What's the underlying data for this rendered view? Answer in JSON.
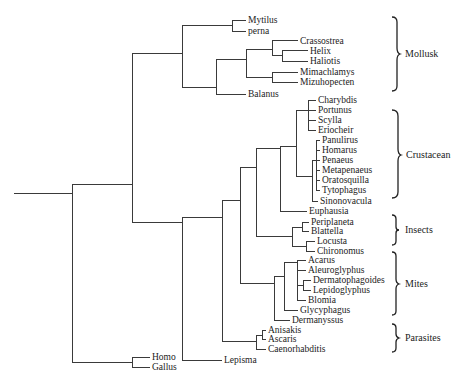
{
  "diagram": {
    "type": "phylogenetic-tree",
    "leaves": [
      {
        "id": "mytilus",
        "label": "Mytilus",
        "x": 248,
        "y": 20
      },
      {
        "id": "perna",
        "label": "perna",
        "x": 248,
        "y": 31
      },
      {
        "id": "crassostrea",
        "label": "Crassostrea",
        "x": 300,
        "y": 41
      },
      {
        "id": "helix",
        "label": "Helix",
        "x": 310,
        "y": 51
      },
      {
        "id": "haliotis",
        "label": "Haliotis",
        "x": 310,
        "y": 61
      },
      {
        "id": "mimachlamys",
        "label": "Mimachlamys",
        "x": 300,
        "y": 72
      },
      {
        "id": "mizuhopecten",
        "label": "Mizuhopecten",
        "x": 300,
        "y": 82
      },
      {
        "id": "balanus",
        "label": "Balanus",
        "x": 248,
        "y": 94
      },
      {
        "id": "charybdis",
        "label": "Charybdis",
        "x": 318,
        "y": 100
      },
      {
        "id": "portunus",
        "label": "Portunus",
        "x": 318,
        "y": 110
      },
      {
        "id": "scylla",
        "label": "Scylla",
        "x": 318,
        "y": 120
      },
      {
        "id": "eriocheir",
        "label": "Eriocheir",
        "x": 318,
        "y": 130
      },
      {
        "id": "panulirus",
        "label": "Panulirus",
        "x": 322,
        "y": 140
      },
      {
        "id": "homarus",
        "label": "Homarus",
        "x": 322,
        "y": 150
      },
      {
        "id": "penaeus",
        "label": "Penaeus",
        "x": 322,
        "y": 160
      },
      {
        "id": "metapenaeus",
        "label": "Metapenaeus",
        "x": 322,
        "y": 170
      },
      {
        "id": "oratosquilla",
        "label": "Oratosquilla",
        "x": 322,
        "y": 180
      },
      {
        "id": "tytophagus",
        "label": "Tytophagus",
        "x": 322,
        "y": 190
      },
      {
        "id": "sinonovacula",
        "label": "Sinonovacula",
        "x": 320,
        "y": 201
      },
      {
        "id": "euphausia",
        "label": "Euphausia",
        "x": 309,
        "y": 211
      },
      {
        "id": "periplaneta",
        "label": "Periplaneta",
        "x": 311,
        "y": 222
      },
      {
        "id": "blattella",
        "label": "Blattella",
        "x": 311,
        "y": 231
      },
      {
        "id": "locusta",
        "label": "Locusta",
        "x": 317,
        "y": 241
      },
      {
        "id": "chironomus",
        "label": "Chironomus",
        "x": 317,
        "y": 251
      },
      {
        "id": "acarus",
        "label": "Acarus",
        "x": 308,
        "y": 260
      },
      {
        "id": "aleuroglyphus",
        "label": "Aleuroglyphus",
        "x": 308,
        "y": 270
      },
      {
        "id": "dermatophagoides",
        "label": "Dermatophagoides",
        "x": 313,
        "y": 280
      },
      {
        "id": "lepidoglyphus",
        "label": "Lepidoglyphus",
        "x": 313,
        "y": 290
      },
      {
        "id": "blomia",
        "label": "Blomia",
        "x": 308,
        "y": 300
      },
      {
        "id": "glycyphagus",
        "label": "Glycyphagus",
        "x": 300,
        "y": 310
      },
      {
        "id": "dermanyssus",
        "label": "Dermanyssus",
        "x": 292,
        "y": 320
      },
      {
        "id": "anisakis",
        "label": "Anisakis",
        "x": 268,
        "y": 330
      },
      {
        "id": "ascaris",
        "label": "Ascaris",
        "x": 268,
        "y": 339
      },
      {
        "id": "caenorhabditis",
        "label": "Caenorhabditis",
        "x": 268,
        "y": 349
      },
      {
        "id": "lepisma",
        "label": "Lepisma",
        "x": 224,
        "y": 360
      },
      {
        "id": "homo",
        "label": "Homo",
        "x": 152,
        "y": 357
      },
      {
        "id": "gallus",
        "label": "Gallus",
        "x": 152,
        "y": 367
      }
    ],
    "groups": [
      {
        "id": "mollusk",
        "label": "Mollusk",
        "y_top": 18,
        "y_bottom": 90
      },
      {
        "id": "crustacean",
        "label": "Crustacean",
        "y_top": 110,
        "y_bottom": 198
      },
      {
        "id": "insects",
        "label": "Insects",
        "y_top": 215,
        "y_bottom": 245
      },
      {
        "id": "mites",
        "label": "Mites",
        "y_top": 252,
        "y_bottom": 315
      },
      {
        "id": "parasites",
        "label": "Parasites",
        "y_top": 324,
        "y_bottom": 352
      }
    ]
  }
}
